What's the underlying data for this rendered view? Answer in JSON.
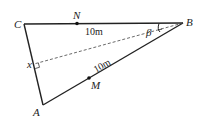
{
  "diagram": {
    "type": "geometry-triangle",
    "points": {
      "A": {
        "label": "A",
        "x": 43,
        "y": 105
      },
      "B": {
        "label": "B",
        "x": 183,
        "y": 23
      },
      "C": {
        "label": "C",
        "x": 24,
        "y": 24
      },
      "N": {
        "label": "N",
        "x": 77,
        "y": 23
      },
      "M": {
        "label": "M",
        "x": 89,
        "y": 78
      }
    },
    "labels": {
      "A": "A",
      "B": "B",
      "C": "C",
      "N": "N",
      "M": "M",
      "x": "x",
      "beta": "β",
      "bn_length": "10m",
      "am_length": "10m"
    },
    "colors": {
      "stroke": "#222222",
      "background": "#ffffff"
    }
  }
}
